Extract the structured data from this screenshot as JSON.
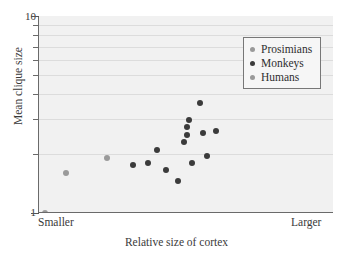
{
  "chart_data": {
    "type": "scatter",
    "title": "",
    "xlabel": "Relative size of cortex",
    "ylabel": "Mean clique size",
    "x_axis": {
      "scale": "linear",
      "min_label": "Smaller",
      "max_label": "Larger",
      "ticks": []
    },
    "y_axis": {
      "scale": "log",
      "ylim": [
        1,
        10
      ],
      "major_ticks": [
        "1",
        "10"
      ],
      "minor_ticks": [
        2,
        3,
        4,
        5,
        6,
        7,
        8,
        9
      ],
      "grid": true
    },
    "legend": {
      "position": "top-right",
      "entries": [
        {
          "name": "Prosimians",
          "color": "#9a9a9a"
        },
        {
          "name": "Monkeys",
          "color": "#3b3b3b"
        },
        {
          "name": "Humans",
          "color": "#9a9a9a"
        }
      ]
    },
    "series": [
      {
        "name": "Prosimians",
        "color": "#9a9a9a",
        "points": [
          {
            "x": 0.02,
            "y": 1.0
          },
          {
            "x": 0.09,
            "y": 1.6
          },
          {
            "x": 0.23,
            "y": 1.9
          }
        ]
      },
      {
        "name": "Monkeys",
        "color": "#3b3b3b",
        "points": [
          {
            "x": 0.32,
            "y": 1.75
          },
          {
            "x": 0.37,
            "y": 1.8
          },
          {
            "x": 0.4,
            "y": 2.1
          },
          {
            "x": 0.43,
            "y": 1.65
          },
          {
            "x": 0.47,
            "y": 1.45
          },
          {
            "x": 0.49,
            "y": 2.3
          },
          {
            "x": 0.5,
            "y": 2.5
          },
          {
            "x": 0.5,
            "y": 2.75
          },
          {
            "x": 0.51,
            "y": 2.95
          },
          {
            "x": 0.52,
            "y": 1.8
          },
          {
            "x": 0.545,
            "y": 3.6
          },
          {
            "x": 0.555,
            "y": 2.55
          },
          {
            "x": 0.57,
            "y": 1.95
          },
          {
            "x": 0.6,
            "y": 2.6
          },
          {
            "x": 0.7,
            "y": 4.4
          }
        ]
      },
      {
        "name": "Humans",
        "color": "#9a9a9a",
        "points": [
          {
            "x": 0.86,
            "y": 5.4
          }
        ]
      }
    ]
  }
}
